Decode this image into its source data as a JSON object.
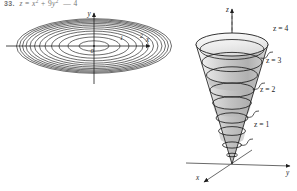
{
  "header": {
    "exercise_number": "33.",
    "equation": "z = x² + 9y² — 4",
    "equation_plain": "z = x2 + 9y2   4"
  },
  "figure": {
    "caption_left": "contour map",
    "caption_right": "elliptic cone surface"
  },
  "contour_plot": {
    "name": "contour-map",
    "axes": {
      "x_label": "x",
      "y_label": "y",
      "origin_label": "0"
    },
    "contour_labels": [
      "1",
      "2"
    ],
    "level_count": 10,
    "description": "concentric ellipses centered at origin"
  },
  "surface_plot": {
    "name": "cone-surface",
    "axes": {
      "x_label": "x",
      "y_label": "y",
      "z_label": "z"
    },
    "level_labels": [
      {
        "text": "z = 4",
        "value": 4
      },
      {
        "text": "z = 3",
        "value": 3
      },
      {
        "text": "z = 2",
        "value": 2
      },
      {
        "text": "z = 1",
        "value": 1
      }
    ],
    "description": "vertically elongated elliptic cone opening upward from the origin with four horizontal level curves"
  },
  "colors": {
    "stroke": "#1d1d1d",
    "surface_light": "#e8e8e8",
    "surface_mid": "#c9c9c9",
    "surface_dark": "#a8a8a8",
    "axis": "#6a6a6a",
    "background": "#ffffff"
  }
}
